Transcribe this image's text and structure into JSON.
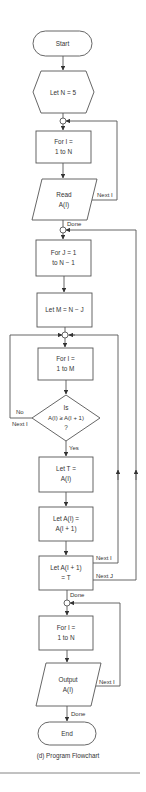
{
  "caption": "(d)  Program Flowchart",
  "nodes": {
    "start": {
      "shape": "terminal",
      "lines": [
        "Start"
      ]
    },
    "let_n": {
      "shape": "hexagon",
      "lines": [
        "Let N  =  5"
      ]
    },
    "for_i_read": {
      "shape": "process",
      "lines": [
        "For I  =",
        "1 to N"
      ]
    },
    "read": {
      "shape": "input",
      "lines": [
        "Read",
        "A(I)"
      ]
    },
    "for_j": {
      "shape": "process",
      "lines": [
        "For J  =  1",
        "to N  −  1"
      ]
    },
    "let_m": {
      "shape": "process",
      "lines": [
        "Let M  =  N − J"
      ]
    },
    "for_i_m": {
      "shape": "process",
      "lines": [
        "For I  =",
        "1 to M"
      ]
    },
    "decision": {
      "shape": "decision",
      "lines": [
        "Is",
        "A(I) ≥ A(I + 1)",
        "?"
      ]
    },
    "let_t": {
      "shape": "process",
      "lines": [
        "Let T  =",
        "A(I)"
      ]
    },
    "let_ai": {
      "shape": "process",
      "lines": [
        "Let A(I)  =",
        "A(I + 1)"
      ]
    },
    "let_ai1": {
      "shape": "process",
      "lines": [
        "Let A(I + 1)",
        "=  T"
      ]
    },
    "for_i_out": {
      "shape": "process",
      "lines": [
        "For I  =",
        "1 to N"
      ]
    },
    "output": {
      "shape": "output",
      "lines": [
        "Output",
        "A(I)"
      ]
    },
    "end": {
      "shape": "terminal",
      "lines": [
        "End"
      ]
    }
  },
  "edge_labels": {
    "next_i_read": "Next I",
    "done_read": "Done",
    "no": "No",
    "next_i_dec": "Next I",
    "yes": "Yes",
    "next_i_swap": "Next I",
    "next_j": "Next J",
    "done_sort": "Done",
    "next_i_out": "Next I",
    "done_out": "Done"
  },
  "colors": {
    "stroke": "#555555",
    "text": "#333333",
    "background": "#ffffff"
  }
}
